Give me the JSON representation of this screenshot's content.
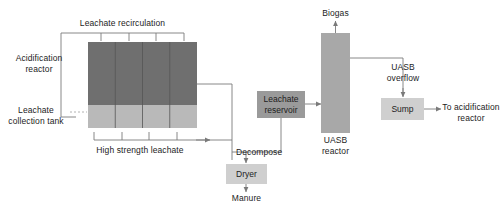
{
  "diagram": {
    "colors": {
      "acidification_fill": "#6f6f6f",
      "collection_tank_fill": "#b9b9b9",
      "uasb_fill": "#a8a8a8",
      "reservoir_fill": "#9a9a9a",
      "sump_fill": "#cfcfcf",
      "dryer_fill": "#cfcfcf",
      "line": "#7a7a7a",
      "text": "#1c1c1c"
    },
    "labels": {
      "leachate_recirculation": "Leachate recirculation",
      "acidification_reactor": "Acidification\nreactor",
      "leachate_collection_tank": "Leachate\ncollection tank",
      "high_strength_leachate": "High strength leachate",
      "decompose": "Decompose",
      "manure": "Manure",
      "biogas": "Biogas",
      "uasb_reactor": "UASB\nreactor",
      "uasb_overflow": "UASB\noverflow",
      "to_acidification_reactor": "To acidification\nreactor"
    },
    "boxes": {
      "leachate_reservoir": "Leachate\nreservoir",
      "dryer": "Dryer",
      "sump": "Sump"
    }
  }
}
